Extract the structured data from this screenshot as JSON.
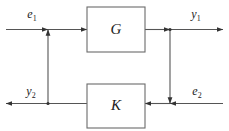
{
  "diagram": {
    "type": "block-diagram",
    "canvas": {
      "width": 229,
      "height": 131,
      "background": "#ffffff"
    },
    "style": {
      "wire_color": "#555555",
      "block_border_color": "#6b6b6b",
      "block_fill": "#ffffff",
      "text_color": "#1c1c1c",
      "arrow_color": "#333333"
    },
    "blocks": [
      {
        "id": "G",
        "label": "G",
        "role": "plant",
        "x": 87,
        "y": 7,
        "width": 58,
        "height": 45,
        "center_x": 116,
        "center_y": 29.5
      },
      {
        "id": "K",
        "label": "K",
        "role": "controller",
        "x": 87,
        "y": 84,
        "width": 58,
        "height": 44,
        "center_x": 116,
        "center_y": 106
      }
    ],
    "signals": [
      {
        "id": "e1",
        "base": "e",
        "subscript": "1",
        "label": "e₁",
        "location": "top-left",
        "direction": "rightward",
        "label_x": 32,
        "label_y": 18
      },
      {
        "id": "y1",
        "base": "y",
        "subscript": "1",
        "label": "y₁",
        "location": "top-right",
        "direction": "rightward",
        "label_x": 196,
        "label_y": 18
      },
      {
        "id": "y2",
        "base": "y",
        "subscript": "2",
        "label": "y₂",
        "location": "bottom-left",
        "direction": "leftward",
        "label_x": 31,
        "label_y": 95
      },
      {
        "id": "e2",
        "base": "e",
        "subscript": "2",
        "label": "e₂",
        "location": "bottom-right",
        "direction": "leftward",
        "label_x": 197,
        "label_y": 95
      }
    ],
    "wires": {
      "top_line_y": 29.5,
      "bottom_line_y": 103.5,
      "left_node_x": 48,
      "right_node_x": 170,
      "left_edge_x": 6,
      "right_edge_x": 223
    },
    "junctions": [
      {
        "id": "summing-junction-top",
        "x": 48,
        "y": 29.5,
        "incoming": "from-below"
      },
      {
        "id": "summing-junction-bottom",
        "x": 170,
        "y": 103.5,
        "incoming": "from-above"
      }
    ]
  }
}
